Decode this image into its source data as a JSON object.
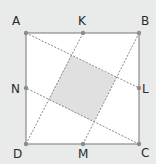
{
  "figure": {
    "type": "geometry-diagram",
    "colors": {
      "background": "#e9eaea",
      "square_fill": "#ffffff",
      "square_stroke": "#8a8a8a",
      "dashed_line": "#7a7a7a",
      "point": "#8c8c8c",
      "shaded_fill": "#e0e0e0",
      "label": "#2a2a2a"
    },
    "points": {
      "A": {
        "label": "A",
        "x": 26,
        "y": 33,
        "lx": 12,
        "ly": 25
      },
      "B": {
        "label": "B",
        "x": 139,
        "y": 33,
        "lx": 141,
        "ly": 25
      },
      "C": {
        "label": "C",
        "x": 139,
        "y": 144,
        "lx": 141,
        "ly": 157
      },
      "D": {
        "label": "D",
        "x": 26,
        "y": 144,
        "lx": 13,
        "ly": 158
      },
      "K": {
        "label": "K",
        "x": 83,
        "y": 33,
        "lx": 78,
        "ly": 25
      },
      "L": {
        "label": "L",
        "x": 139,
        "y": 88,
        "lx": 142,
        "ly": 93
      },
      "M": {
        "label": "M",
        "x": 83,
        "y": 144,
        "lx": 78,
        "ly": 158
      },
      "N": {
        "label": "N",
        "x": 26,
        "y": 88,
        "lx": 11,
        "ly": 93
      }
    },
    "segments": [
      {
        "from": "A",
        "to": "L",
        "style": "dashed"
      },
      {
        "from": "B",
        "to": "M",
        "style": "dashed"
      },
      {
        "from": "C",
        "to": "N",
        "style": "dashed"
      },
      {
        "from": "D",
        "to": "K",
        "style": "dashed"
      }
    ],
    "inner_square": [
      [
        71.2,
        55.2
      ],
      [
        116.4,
        77.4
      ],
      [
        93.8,
        121.8
      ],
      [
        48.6,
        99.6
      ]
    ]
  }
}
